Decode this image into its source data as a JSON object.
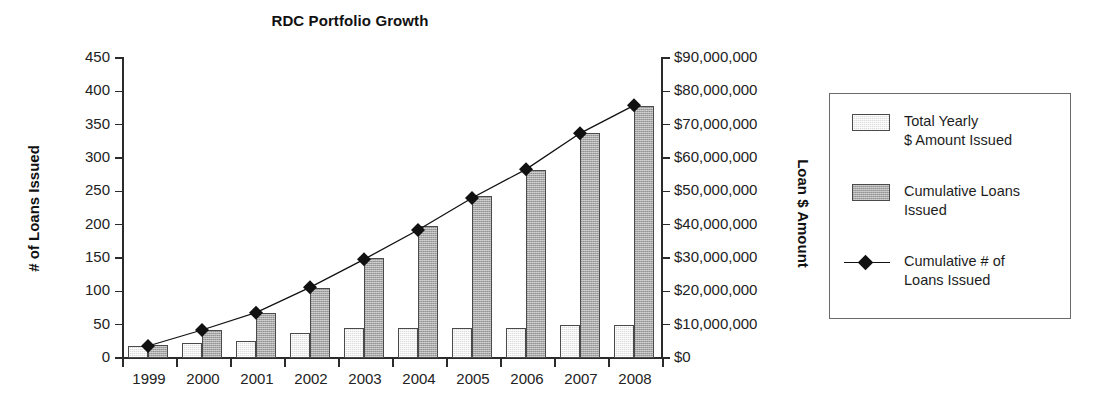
{
  "chart_data": {
    "type": "bar",
    "title": "RDC Portfolio Growth",
    "xlabel": "",
    "ylabel": "# of Loans Issued",
    "y2label": "Loan $ Amount",
    "categories": [
      "1999",
      "2000",
      "2001",
      "2002",
      "2003",
      "2004",
      "2005",
      "2006",
      "2007",
      "2008"
    ],
    "ylim": [
      0,
      450
    ],
    "y2lim": [
      0,
      90000000
    ],
    "grid": false,
    "legend_position": "right",
    "yticks": [
      "0",
      "50",
      "100",
      "150",
      "200",
      "250",
      "300",
      "350",
      "400",
      "450"
    ],
    "ytick_values": [
      0,
      50,
      100,
      150,
      200,
      250,
      300,
      350,
      400,
      450
    ],
    "y2ticks": [
      "$0",
      "$10,000,000",
      "$20,000,000",
      "$30,000,000",
      "$40,000,000",
      "$50,000,000",
      "$60,000,000",
      "$70,000,000",
      "$80,000,000",
      "$90,000,000"
    ],
    "y2tick_values": [
      0,
      10000000,
      20000000,
      30000000,
      40000000,
      50000000,
      60000000,
      70000000,
      80000000,
      90000000
    ],
    "series": [
      {
        "name": "Total Yearly\n$ Amount Issued",
        "legend_label": "Total Yearly\n$ Amount Issued",
        "kind": "bar",
        "axis": "right",
        "fill": "#dcdcdc",
        "values": [
          3500000,
          4500000,
          5000000,
          7500000,
          9000000,
          9000000,
          9000000,
          9000000,
          10000000,
          9800000
        ]
      },
      {
        "name": "Cumulative Loans\nIssued",
        "legend_label": "Cumulative Loans\nIssued",
        "kind": "bar",
        "axis": "right",
        "fill": "#a8a8a8",
        "values": [
          4000000,
          8500000,
          13500000,
          21000000,
          30000000,
          39500000,
          48500000,
          56500000,
          67500000,
          75500000
        ]
      },
      {
        "name": "Cumulative # of\nLoans Issued",
        "legend_label": "Cumulative # of\nLoans Issued",
        "kind": "line",
        "axis": "left",
        "marker": "diamond",
        "color": "#111111",
        "values": [
          18,
          42,
          68,
          106,
          148,
          192,
          240,
          283,
          337,
          379
        ]
      }
    ]
  },
  "colors": {
    "axis": "#2b2b2b",
    "text": "#1a1a1a",
    "bar_light": "#dcdcdc",
    "bar_dark": "#a8a8a8",
    "line": "#111111",
    "legend_border": "#6a6a6a",
    "background": "#ffffff"
  }
}
